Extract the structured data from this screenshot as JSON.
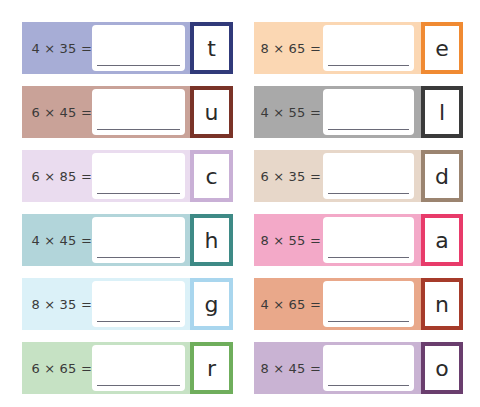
{
  "worksheet": {
    "left_column": [
      {
        "problem": "4 × 35 =",
        "answer": "",
        "letter": "t",
        "band_color": "#a7add6",
        "border_color": "#313a7a"
      },
      {
        "problem": "6 × 45 =",
        "answer": "",
        "letter": "u",
        "band_color": "#c9a298",
        "border_color": "#7a3328"
      },
      {
        "problem": "6 × 85 =",
        "answer": "",
        "letter": "c",
        "band_color": "#eadcef",
        "border_color": "#c9b0d6"
      },
      {
        "problem": "4 × 45 =",
        "answer": "",
        "letter": "h",
        "band_color": "#b2d5da",
        "border_color": "#3e8a86"
      },
      {
        "problem": "8 × 35 =",
        "answer": "",
        "letter": "g",
        "band_color": "#dbf1f8",
        "border_color": "#a9d6ee"
      },
      {
        "problem": "6 × 65 =",
        "answer": "",
        "letter": "r",
        "band_color": "#c6e2c4",
        "border_color": "#6fae5c"
      }
    ],
    "right_column": [
      {
        "problem": "8 × 65 =",
        "answer": "",
        "letter": "e",
        "band_color": "#fbd7b3",
        "border_color": "#f08a32"
      },
      {
        "problem": "4 × 55 =",
        "answer": "",
        "letter": "l",
        "band_color": "#a9a9a9",
        "border_color": "#3a3a3a"
      },
      {
        "problem": "6 × 35 =",
        "answer": "",
        "letter": "d",
        "band_color": "#e7d7c9",
        "border_color": "#9b8470"
      },
      {
        "problem": "8 × 55 =",
        "answer": "",
        "letter": "a",
        "band_color": "#f3a9c8",
        "border_color": "#e83b6a"
      },
      {
        "problem": "4 × 65 =",
        "answer": "",
        "letter": "n",
        "band_color": "#e9a88a",
        "border_color": "#a63b2a"
      },
      {
        "problem": "8 × 45 =",
        "answer": "",
        "letter": "o",
        "band_color": "#c9b3d3",
        "border_color": "#6a3e6e"
      }
    ]
  }
}
